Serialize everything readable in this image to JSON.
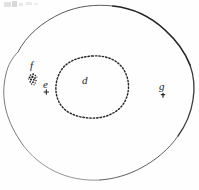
{
  "figure": {
    "background_color": "#fefefe",
    "ink_color": "#1d1d1d",
    "line_color_dark": "#2a2a2a",
    "line_color_light": "#8a8a8a",
    "labels": [
      {
        "id": "f",
        "text": "f",
        "x": 32,
        "y": 64,
        "marker": "dot-cluster"
      },
      {
        "id": "e",
        "text": "e",
        "x": 45,
        "y": 80,
        "marker": "plus-mark"
      },
      {
        "id": "d",
        "text": "d",
        "x": 84,
        "y": 76,
        "marker": "none"
      },
      {
        "id": "g",
        "text": "g",
        "x": 161,
        "y": 83,
        "marker": "tick-mark"
      }
    ],
    "contours": [
      {
        "name": "outer-contour",
        "style": "solid",
        "stroke_weight_range": [
          0.6,
          1.8
        ],
        "description": "irregular rounded closed outline spanning nearly the full frame"
      },
      {
        "name": "inner-contour",
        "style": "dotted",
        "stroke_weight_range": [
          1.0,
          1.6
        ],
        "description": "stippled rounded-square closed outline enclosing label d"
      }
    ],
    "artifacts": {
      "top_left_smudge": "illegible faint scanner marks"
    }
  }
}
